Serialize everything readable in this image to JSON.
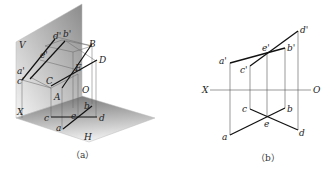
{
  "figure_a": {
    "caption": "（a）",
    "labels": {
      "V": "V",
      "H": "H",
      "X": "X",
      "O": "O",
      "A": "A",
      "B": "B",
      "C": "C",
      "D": "D",
      "E": "E",
      "a": "a",
      "b": "b",
      "c": "c",
      "d": "d",
      "e": "e",
      "a_prime": "a'",
      "b_prime": "b'",
      "c_prime": "c'",
      "d_prime": "d'",
      "e_prime": "e'"
    }
  },
  "figure_b": {
    "caption": "（b）",
    "labels": {
      "X": "X",
      "O": "O",
      "a": "a",
      "b": "b",
      "c": "c",
      "d": "d",
      "e": "e",
      "a_prime": "a'",
      "b_prime": "b'",
      "c_prime": "c'",
      "d_prime": "d'",
      "e_prime": "e'"
    }
  },
  "colors": {
    "plane_dark": "#8a8a8a",
    "plane_light": "#f2f2f2",
    "line_thick": "#1a1a1a",
    "line_thin": "#555555"
  }
}
